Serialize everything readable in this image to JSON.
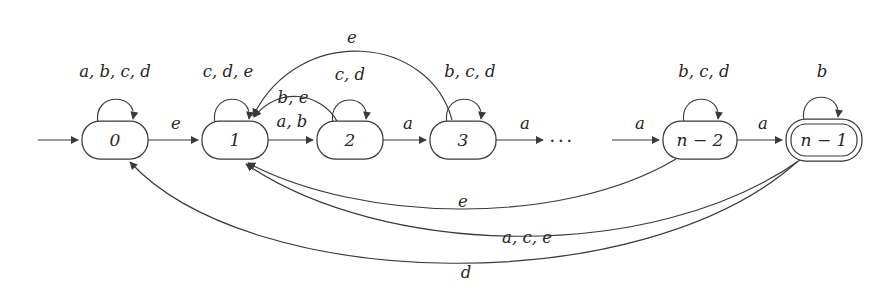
{
  "figure": {
    "kind": "finite-automaton-state-diagram",
    "alphabet": [
      "a",
      "b",
      "c",
      "d",
      "e"
    ],
    "ellipsis": "···"
  },
  "states": [
    {
      "id": "s0",
      "label": "0",
      "x": 115,
      "y": 140,
      "rx": 33,
      "ry": 19,
      "accepting": false,
      "start": true
    },
    {
      "id": "s1",
      "label": "1",
      "x": 235,
      "y": 140,
      "rx": 33,
      "ry": 19,
      "accepting": false,
      "start": false
    },
    {
      "id": "s2",
      "label": "2",
      "x": 350,
      "y": 140,
      "rx": 33,
      "ry": 19,
      "accepting": false,
      "start": false
    },
    {
      "id": "s3",
      "label": "3",
      "x": 463,
      "y": 140,
      "rx": 33,
      "ry": 19,
      "accepting": false,
      "start": false
    },
    {
      "id": "sn-2",
      "label": "n − 2",
      "x": 700,
      "y": 140,
      "rx": 37,
      "ry": 19,
      "accepting": false,
      "start": false
    },
    {
      "id": "sn-1",
      "label": "n − 1",
      "x": 824,
      "y": 140,
      "rx": 38,
      "ry": 20,
      "accepting": true,
      "start": false
    }
  ],
  "self_loops": [
    {
      "state": "s0",
      "label": "a, b, c, d",
      "label_x": 115,
      "label_y": 72
    },
    {
      "state": "s1",
      "label": "c, d, e",
      "label_x": 228,
      "label_y": 72
    },
    {
      "state": "s2",
      "label": "c, d",
      "label_x": 350,
      "label_y": 75
    },
    {
      "state": "s3",
      "label": "b, c, d",
      "label_x": 470,
      "label_y": 72
    },
    {
      "state": "sn-2",
      "label": "b, c, d",
      "label_x": 704,
      "label_y": 72
    },
    {
      "state": "sn-1",
      "label": "b",
      "label_x": 822,
      "label_y": 72
    }
  ],
  "transitions": [
    {
      "id": "t-start",
      "from": "",
      "to": "s0",
      "label": "",
      "label_x": 0,
      "label_y": 0
    },
    {
      "id": "t-0-1",
      "from": "s0",
      "to": "s1",
      "label": "e",
      "label_x": 176,
      "label_y": 124
    },
    {
      "id": "t-1-2",
      "from": "s1",
      "to": "s2",
      "label": "a, b",
      "label_x": 292,
      "label_y": 122
    },
    {
      "id": "t-2-3",
      "from": "s2",
      "to": "s3",
      "label": "a",
      "label_x": 408,
      "label_y": 124
    },
    {
      "id": "t-3-dots",
      "from": "s3",
      "to": "",
      "label": "a",
      "label_x": 525,
      "label_y": 124
    },
    {
      "id": "t-dots-n2",
      "from": "",
      "to": "sn-2",
      "label": "a",
      "label_x": 640,
      "label_y": 124
    },
    {
      "id": "t-n2-n1",
      "from": "sn-2",
      "to": "sn-1",
      "label": "a",
      "label_x": 763,
      "label_y": 124
    },
    {
      "id": "t-2-1",
      "from": "s2",
      "to": "s1",
      "label": "b, e",
      "label_x": 293,
      "label_y": 98
    },
    {
      "id": "t-3-1",
      "from": "s3",
      "to": "s1",
      "label": "e",
      "label_x": 352,
      "label_y": 38
    },
    {
      "id": "t-n2-1",
      "from": "sn-2",
      "to": "s1",
      "label": "e",
      "label_x": 463,
      "label_y": 202
    },
    {
      "id": "t-n1-1",
      "from": "sn-1",
      "to": "s1",
      "label": "a, c, e",
      "label_x": 527,
      "label_y": 238
    },
    {
      "id": "t-n1-0",
      "from": "sn-1",
      "to": "s0",
      "label": "d",
      "label_x": 466,
      "label_y": 273
    }
  ]
}
